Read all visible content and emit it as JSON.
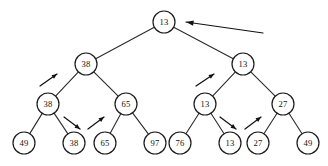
{
  "diagram": {
    "type": "binary-tree",
    "canvas": {
      "width": 328,
      "height": 166,
      "background": "#ffffff"
    },
    "stroke_color": "#1c1c1c",
    "node_radius": 11,
    "levels": [
      {
        "level": 0,
        "y": 22,
        "node_ids": [
          "n0"
        ]
      },
      {
        "level": 1,
        "y": 64,
        "node_ids": [
          "n1",
          "n2"
        ]
      },
      {
        "level": 2,
        "y": 104,
        "node_ids": [
          "n3",
          "n4",
          "n5",
          "n6"
        ]
      },
      {
        "level": 3,
        "y": 143,
        "node_ids": [
          "n7",
          "n8",
          "n9",
          "n10",
          "n11",
          "n12",
          "n13",
          "n14"
        ]
      }
    ],
    "nodes": [
      {
        "id": "n0",
        "label": "13",
        "x": 164,
        "y": 22,
        "level": 0,
        "position": "root"
      },
      {
        "id": "n1",
        "label": "38",
        "x": 86,
        "y": 64,
        "level": 1,
        "position": "left"
      },
      {
        "id": "n2",
        "label": "13",
        "x": 243,
        "y": 64,
        "level": 1,
        "position": "right"
      },
      {
        "id": "n3",
        "label": "38",
        "x": 48,
        "y": 104,
        "level": 2,
        "position": "left-left"
      },
      {
        "id": "n4",
        "label": "65",
        "x": 126,
        "y": 104,
        "level": 2,
        "position": "left-right"
      },
      {
        "id": "n5",
        "label": "13",
        "x": 205,
        "y": 104,
        "level": 2,
        "position": "right-left"
      },
      {
        "id": "n6",
        "label": "27",
        "x": 283,
        "y": 104,
        "level": 2,
        "position": "right-right"
      },
      {
        "id": "n7",
        "label": "49",
        "x": 24,
        "y": 143,
        "level": 3,
        "position": "leaf-1"
      },
      {
        "id": "n8",
        "label": "38",
        "x": 74,
        "y": 143,
        "level": 3,
        "position": "leaf-2"
      },
      {
        "id": "n9",
        "label": "65",
        "x": 105,
        "y": 143,
        "level": 3,
        "position": "leaf-3"
      },
      {
        "id": "n10",
        "label": "97",
        "x": 155,
        "y": 143,
        "level": 3,
        "position": "leaf-4"
      },
      {
        "id": "n11",
        "label": "76",
        "x": 180,
        "y": 143,
        "level": 3,
        "position": "leaf-5"
      },
      {
        "id": "n12",
        "label": "13",
        "x": 230,
        "y": 143,
        "level": 3,
        "position": "leaf-6"
      },
      {
        "id": "n13",
        "label": "27",
        "x": 258,
        "y": 143,
        "level": 3,
        "position": "leaf-7"
      },
      {
        "id": "n14",
        "label": "49",
        "x": 308,
        "y": 143,
        "level": 3,
        "position": "leaf-8"
      }
    ],
    "edges": [
      {
        "from": "n0",
        "to": "n1"
      },
      {
        "from": "n0",
        "to": "n2"
      },
      {
        "from": "n1",
        "to": "n3"
      },
      {
        "from": "n1",
        "to": "n4"
      },
      {
        "from": "n2",
        "to": "n5"
      },
      {
        "from": "n2",
        "to": "n6"
      },
      {
        "from": "n3",
        "to": "n7"
      },
      {
        "from": "n3",
        "to": "n8"
      },
      {
        "from": "n4",
        "to": "n9"
      },
      {
        "from": "n4",
        "to": "n10"
      },
      {
        "from": "n5",
        "to": "n11"
      },
      {
        "from": "n5",
        "to": "n12"
      },
      {
        "from": "n6",
        "to": "n13"
      },
      {
        "from": "n6",
        "to": "n14"
      }
    ],
    "arrows": [
      {
        "id": "a-main",
        "name": "root-pointer-arrow",
        "kind": "long-pointer",
        "direction": "left",
        "x1": 263,
        "y1": 33,
        "x2": 186,
        "y2": 22
      },
      {
        "id": "a1",
        "name": "swap-arrow-left-subtree-up",
        "kind": "short-swap",
        "direction": "up-right",
        "x1": 40,
        "y1": 86,
        "x2": 57,
        "y2": 74
      },
      {
        "id": "a2",
        "name": "swap-arrow-leaf38-down",
        "kind": "short-swap",
        "direction": "down-right",
        "x1": 64,
        "y1": 117,
        "x2": 80,
        "y2": 129
      },
      {
        "id": "a3",
        "name": "swap-arrow-leaf65-up",
        "kind": "short-swap",
        "direction": "up-right",
        "x1": 88,
        "y1": 129,
        "x2": 104,
        "y2": 117
      },
      {
        "id": "a4",
        "name": "swap-arrow-right-subtree-up",
        "kind": "short-swap",
        "direction": "up-right",
        "x1": 196,
        "y1": 86,
        "x2": 214,
        "y2": 74
      },
      {
        "id": "a5",
        "name": "swap-arrow-leaf13-down",
        "kind": "short-swap",
        "direction": "down-right",
        "x1": 220,
        "y1": 117,
        "x2": 236,
        "y2": 129
      },
      {
        "id": "a6",
        "name": "swap-arrow-leaf27-up",
        "kind": "short-swap",
        "direction": "up-right",
        "x1": 245,
        "y1": 129,
        "x2": 261,
        "y2": 117
      }
    ]
  }
}
